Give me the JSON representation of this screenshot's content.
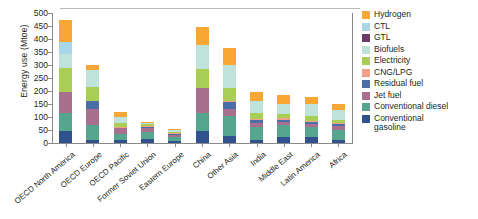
{
  "axis": {
    "ylabel": "Energy use (Mtoe)",
    "yticks": [
      0,
      50,
      100,
      150,
      200,
      250,
      300,
      350,
      400,
      450,
      500
    ]
  },
  "chart_data": {
    "type": "bar",
    "title": "",
    "xlabel": "",
    "ylabel": "Energy use (Mtoe)",
    "ylim": [
      0,
      500
    ],
    "grid": false,
    "stacked": true,
    "legend_position": "right",
    "categories": [
      "OECD North America",
      "OECD Europe",
      "OECD Pacific",
      "Former Soviet Union",
      "Eastern Europe",
      "China",
      "Other Asia",
      "India",
      "Middle East",
      "Latin America",
      "Africa"
    ],
    "series": [
      {
        "name": "Conventional gasoline",
        "color": "#31508e",
        "values": [
          47,
          13,
          10,
          14,
          8,
          47,
          26,
          12,
          23,
          22,
          10
        ]
      },
      {
        "name": "Conventional diesel",
        "color": "#56a58e",
        "values": [
          68,
          57,
          25,
          30,
          14,
          68,
          78,
          48,
          45,
          40,
          40
        ]
      },
      {
        "name": "Jet fuel",
        "color": "#a86f8f",
        "values": [
          82,
          60,
          22,
          12,
          9,
          96,
          26,
          18,
          14,
          12,
          16
        ]
      },
      {
        "name": "Residual fuel",
        "color": "#4a6fa8",
        "values": [
          0,
          30,
          0,
          6,
          4,
          0,
          26,
          10,
          8,
          7,
          6
        ]
      },
      {
        "name": "CNG/LPG",
        "color": "#f3a08a",
        "values": [
          0,
          0,
          5,
          4,
          3,
          0,
          5,
          5,
          5,
          5,
          4
        ]
      },
      {
        "name": "Electricity",
        "color": "#a8ce54",
        "values": [
          90,
          55,
          14,
          6,
          6,
          73,
          50,
          22,
          18,
          18,
          14
        ]
      },
      {
        "name": "Biofuels",
        "color": "#bfe3da",
        "values": [
          55,
          65,
          24,
          5,
          5,
          95,
          88,
          45,
          38,
          45,
          38
        ]
      },
      {
        "name": "GTL",
        "color": "#6b3a66",
        "values": [
          0,
          0,
          0,
          0,
          0,
          0,
          0,
          0,
          0,
          0,
          0
        ]
      },
      {
        "name": "CTL",
        "color": "#a9d7ea",
        "values": [
          45,
          0,
          0,
          0,
          0,
          0,
          0,
          0,
          0,
          0,
          0
        ]
      },
      {
        "name": "Hydrogen",
        "color": "#f8a634",
        "values": [
          85,
          20,
          20,
          6,
          6,
          66,
          65,
          35,
          32,
          28,
          22
        ]
      }
    ],
    "totals": [
      472,
      300,
      120,
      83,
      55,
      445,
      364,
      195,
      183,
      177,
      150
    ]
  },
  "legend": {
    "items": [
      {
        "label": "Hydrogen",
        "color": "#f8a634"
      },
      {
        "label": "CTL",
        "color": "#a9d7ea"
      },
      {
        "label": "GTL",
        "color": "#6b3a66"
      },
      {
        "label": "Biofuels",
        "color": "#bfe3da"
      },
      {
        "label": "Electricity",
        "color": "#a8ce54"
      },
      {
        "label": "CNG/LPG",
        "color": "#f3a08a"
      },
      {
        "label": "Residual fuel",
        "color": "#4a6fa8"
      },
      {
        "label": "Jet fuel",
        "color": "#a86f8f"
      },
      {
        "label": "Conventional diesel",
        "color": "#56a58e"
      },
      {
        "label": "Conventional\ngasoline",
        "color": "#31508e"
      }
    ]
  }
}
